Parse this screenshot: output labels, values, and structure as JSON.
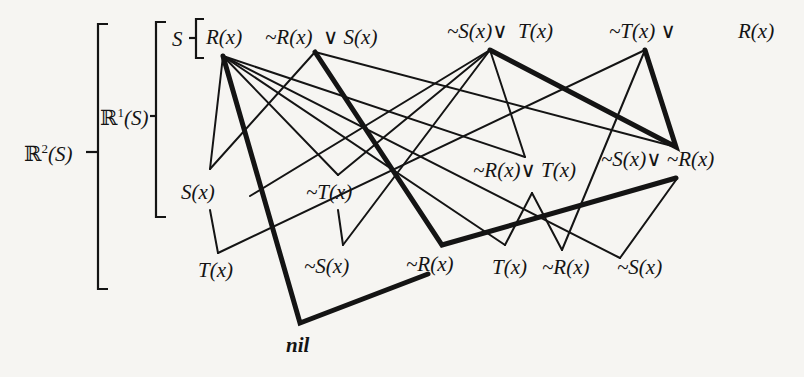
{
  "diagram": {
    "type": "resolution-refutation-graph",
    "levels": {
      "r2": {
        "prefix": "ℝ",
        "sup": "2",
        "arg": "(S)"
      },
      "r1": {
        "prefix": "ℝ",
        "sup": "1",
        "arg": "(S)"
      },
      "s": "S"
    },
    "clauses_top": [
      {
        "id": "c1",
        "label": "R(x)"
      },
      {
        "id": "c2",
        "label": "~R(x)  ∨ S(x)"
      },
      {
        "id": "c3",
        "label": "~S(x)∨  T(x)"
      },
      {
        "id": "c4",
        "label": "~T(x) ∨"
      },
      {
        "id": "c4b",
        "label": "R(x)"
      }
    ],
    "resolvents_level1": [
      {
        "id": "r1",
        "label": "S(x)"
      },
      {
        "id": "r2",
        "label": "~T(x)"
      },
      {
        "id": "r3",
        "label": "~R(x)∨ T(x)"
      },
      {
        "id": "r4",
        "label": "~S(x)∨ ~R(x)"
      }
    ],
    "resolvents_level2": [
      {
        "id": "b1",
        "label": "T(x)"
      },
      {
        "id": "b2",
        "label": "~S(x)"
      },
      {
        "id": "b3",
        "label": "~R(x)"
      },
      {
        "id": "b4",
        "label": "T(x)"
      },
      {
        "id": "b5",
        "label": "~R(x)"
      },
      {
        "id": "b6",
        "label": "~S(x)"
      }
    ],
    "empty_clause": "nil",
    "colors": {
      "ink": "#141414",
      "paper": "#f6f5f2"
    }
  }
}
